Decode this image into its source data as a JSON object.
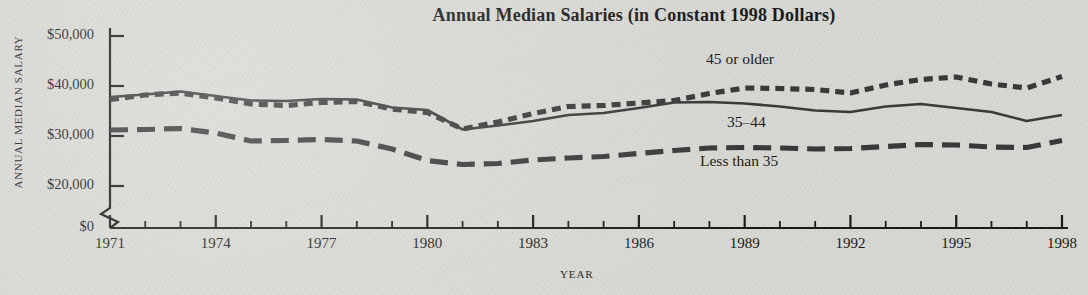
{
  "chart_data": {
    "type": "line",
    "title": "Annual Median Salaries (in Constant 1998 Dollars)",
    "xlabel": "YEAR",
    "ylabel": "ANNUAL MEDIAN SALARY",
    "grid": false,
    "legend_position": "inline-series-labels",
    "axis_break": true,
    "axis_break_note": "y-axis broken between $0 and $20,000",
    "ylim": [
      0,
      50000
    ],
    "ytick_values": [
      0,
      20000,
      30000,
      40000,
      50000
    ],
    "ytick_labels": [
      "$0",
      "$20,000",
      "$30,000",
      "$40,000",
      "$50,000"
    ],
    "xlim": [
      1971,
      1998
    ],
    "xtick_labels": [
      "1971",
      "1974",
      "1977",
      "1980",
      "1983",
      "1986",
      "1989",
      "1992",
      "1995",
      "1998"
    ],
    "xtick_values": [
      1971,
      1974,
      1977,
      1980,
      1983,
      1986,
      1989,
      1992,
      1995,
      1998
    ],
    "x": [
      1971,
      1972,
      1973,
      1974,
      1975,
      1976,
      1977,
      1978,
      1979,
      1980,
      1981,
      1982,
      1983,
      1984,
      1985,
      1986,
      1987,
      1988,
      1989,
      1990,
      1991,
      1992,
      1993,
      1994,
      1995,
      1996,
      1997,
      1998
    ],
    "series": [
      {
        "name": "45 or older",
        "style": "short-dashed",
        "color": "#3a3a3a",
        "values": [
          37300,
          38200,
          38600,
          37600,
          36400,
          36100,
          36700,
          36900,
          35400,
          34700,
          31400,
          32800,
          34500,
          35900,
          36100,
          36600,
          37100,
          38500,
          39600,
          39500,
          39300,
          38600,
          40200,
          41300,
          41800,
          40400,
          39600,
          41900
        ]
      },
      {
        "name": "35–44",
        "style": "solid",
        "color": "#3a3a3a",
        "values": [
          37800,
          38300,
          38900,
          38000,
          37100,
          37000,
          37400,
          37300,
          35700,
          35200,
          31300,
          32100,
          33000,
          34200,
          34600,
          35600,
          36700,
          36800,
          36500,
          35900,
          35100,
          34800,
          35900,
          36400,
          35600,
          34800,
          33000,
          34200
        ]
      },
      {
        "name": "Less than 35",
        "style": "long-dashed",
        "color": "#3a3a3a",
        "values": [
          31200,
          31300,
          31500,
          30600,
          29000,
          29100,
          29300,
          29000,
          27400,
          25100,
          24300,
          24500,
          25200,
          25600,
          25900,
          26500,
          27100,
          27600,
          27700,
          27600,
          27400,
          27500,
          27900,
          28300,
          28200,
          27800,
          27700,
          29100
        ]
      }
    ]
  },
  "axis": {
    "y_title": "ANNUAL MEDIAN SALARY",
    "x_title": "YEAR"
  },
  "labels": {
    "older": "45 or older",
    "mid": "35–44",
    "young": "Less than 35"
  },
  "colors": {
    "background": "#d9d9d5",
    "ink": "#1b1b1b",
    "line": "#3a3a3a"
  }
}
